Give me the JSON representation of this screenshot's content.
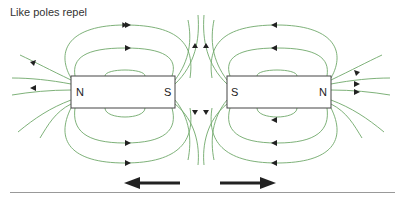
{
  "title": "Like poles repel",
  "magnets": [
    {
      "name": "left-magnet",
      "left_pole": "N",
      "right_pole": "S"
    },
    {
      "name": "right-magnet",
      "left_pole": "S",
      "right_pole": "N"
    }
  ],
  "colors": {
    "field_line": "#6fa86a",
    "magnet_border": "#444444",
    "arrow": "#222222",
    "rule": "#999999"
  },
  "force_arrows": [
    {
      "direction": "left"
    },
    {
      "direction": "right"
    }
  ]
}
